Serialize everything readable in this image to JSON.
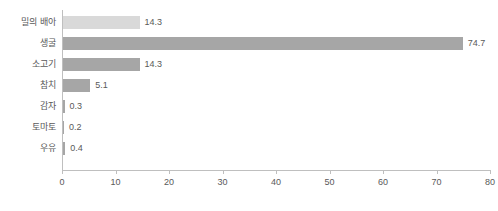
{
  "chart_data": {
    "type": "bar",
    "orientation": "horizontal",
    "title": "",
    "xlabel": "",
    "ylabel": "",
    "xlim": [
      0,
      80
    ],
    "xticks": [
      0,
      10,
      20,
      30,
      40,
      50,
      60,
      70,
      80
    ],
    "grid": false,
    "legend": false,
    "categories": [
      "밀의 배아",
      "생굴",
      "소고기",
      "참치",
      "감자",
      "토마토",
      "우유"
    ],
    "values": [
      14.3,
      74.7,
      14.3,
      5.1,
      0.3,
      0.2,
      0.4
    ],
    "value_labels": [
      "14.3",
      "74.7",
      "14.3",
      "5.1",
      "0.3",
      "0.2",
      "0.4"
    ],
    "bar_colors": [
      "#d9d9d9",
      "#a6a6a6",
      "#a6a6a6",
      "#a6a6a6",
      "#a6a6a6",
      "#a6a6a6",
      "#a6a6a6"
    ],
    "axis_color": "#bfbfbf",
    "text_color": "#595959"
  }
}
